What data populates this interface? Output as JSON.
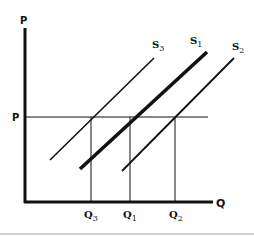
{
  "diagram": {
    "type": "supply-shift",
    "axes": {
      "y_label": "P",
      "x_label": "Q"
    },
    "price_level_label": "P",
    "curves": [
      {
        "id": "S3",
        "base": "S",
        "sub": "3",
        "emphasis": "normal"
      },
      {
        "id": "S1",
        "base": "S",
        "sub": "1",
        "emphasis": "bold"
      },
      {
        "id": "S2",
        "base": "S",
        "sub": "2",
        "emphasis": "normal"
      }
    ],
    "quantities": [
      {
        "id": "Q3",
        "base": "Q",
        "sub": "3"
      },
      {
        "id": "Q1",
        "base": "Q",
        "sub": "1"
      },
      {
        "id": "Q2",
        "base": "Q",
        "sub": "2"
      }
    ],
    "colors": {
      "line": "#111111",
      "background": "#ffffff",
      "divider": "#cfcfcf"
    }
  }
}
